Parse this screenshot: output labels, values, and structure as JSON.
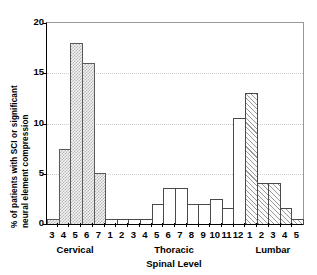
{
  "chart_data": {
    "type": "bar",
    "title": "",
    "xlabel": "Spinal Level",
    "ylabel_line1": "% of patients with SCI or significant",
    "ylabel_line2": "neural element compression",
    "ylim": [
      0,
      20
    ],
    "yticks": [
      0,
      5,
      10,
      15,
      20
    ],
    "ytick_labels": [
      "0",
      "5",
      "10",
      "15",
      "20"
    ],
    "grid": true,
    "legend": "none",
    "categories": [
      "3",
      "4",
      "5",
      "6",
      "7",
      "1",
      "2",
      "3",
      "4",
      "5",
      "6",
      "7",
      "8",
      "9",
      "10",
      "11",
      "12",
      "1",
      "2",
      "3",
      "4",
      "5"
    ],
    "values": [
      0.5,
      7.5,
      18.0,
      16.0,
      5.1,
      0.5,
      0.5,
      0.5,
      0.5,
      2.0,
      3.6,
      3.6,
      2.0,
      2.0,
      2.5,
      1.6,
      10.5,
      13.0,
      4.1,
      4.1,
      1.6,
      0.5
    ],
    "groups": [
      {
        "label": "Cervical",
        "start": 0,
        "count": 5,
        "fill": "checker"
      },
      {
        "label": "Thoracic",
        "start": 5,
        "count": 12,
        "fill": "empty"
      },
      {
        "label": "Lumbar",
        "start": 17,
        "count": 5,
        "fill": "hatch"
      }
    ],
    "colors": {
      "axis": "#000000",
      "bar_outline": "#4a4a4a",
      "grid": "#cccccc",
      "background": "#ffffff"
    }
  }
}
